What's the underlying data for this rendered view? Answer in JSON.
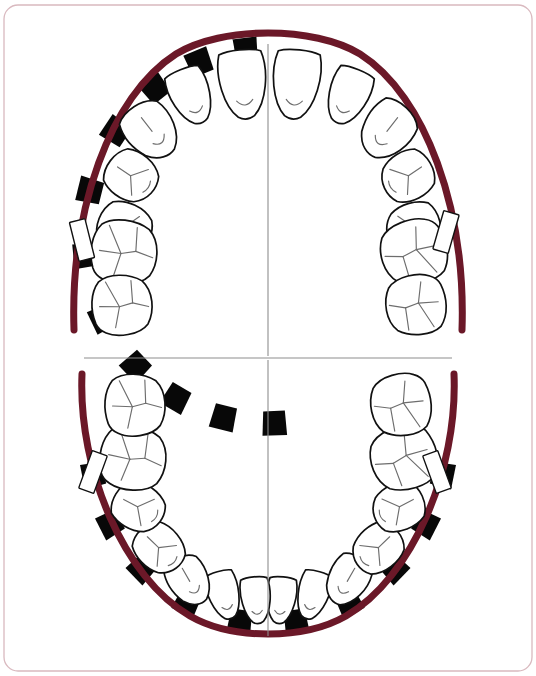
{
  "document": {
    "title": "Dental Arch Chart",
    "type": "odontogram",
    "width": 536,
    "height": 676
  },
  "colors": {
    "arch": "#6b1828",
    "arch_highlight": "#8c2236",
    "tooth_fill": "#ffffff",
    "tooth_outline": "#111111",
    "groove": "#6d6d6d",
    "marker_black": "#080808",
    "marker_white": "#ffffff",
    "frame_border": "#d9b9bf",
    "midline": "#8e8e8e",
    "background": "#ffffff"
  },
  "frame": {
    "x": 4,
    "y": 5,
    "width": 528,
    "height": 666,
    "corner_radius": 14
  },
  "guides": {
    "horizontal_divider": {
      "x1": 84,
      "y1": 358,
      "x2": 452,
      "y2": 358
    },
    "upper_midline": {
      "x1": 268,
      "y1": 44,
      "x2": 268,
      "y2": 356
    },
    "lower_midline": {
      "x1": 268,
      "y1": 360,
      "x2": 268,
      "y2": 636
    }
  },
  "arches": {
    "upper": {
      "label": "Maxillary arch",
      "path": "M 74,330 C 70,210 110,96 176,54 C 222,26 314,26 360,54 C 426,96 466,210 462,330",
      "stroke_width": 7
    },
    "lower": {
      "label": "Mandibular arch",
      "path": "M 82,374 C 78,470 124,578 190,616 C 232,640 304,640 346,616 C 412,578 458,470 454,374",
      "stroke_width": 7
    }
  },
  "teeth": {
    "upper_right_quadrant": [
      {
        "name": "central-incisor",
        "notation": "11",
        "type": "incisor"
      },
      {
        "name": "lateral-incisor",
        "notation": "12",
        "type": "incisor"
      },
      {
        "name": "canine",
        "notation": "13",
        "type": "canine"
      },
      {
        "name": "first-premolar",
        "notation": "14",
        "type": "premolar"
      },
      {
        "name": "second-premolar",
        "notation": "15",
        "type": "premolar"
      },
      {
        "name": "first-molar",
        "notation": "16",
        "type": "molar"
      },
      {
        "name": "second-molar",
        "notation": "17",
        "type": "molar"
      }
    ],
    "upper_left_quadrant": [
      {
        "name": "central-incisor",
        "notation": "21",
        "type": "incisor"
      },
      {
        "name": "lateral-incisor",
        "notation": "22",
        "type": "incisor"
      },
      {
        "name": "canine",
        "notation": "23",
        "type": "canine"
      },
      {
        "name": "first-premolar",
        "notation": "24",
        "type": "premolar"
      },
      {
        "name": "second-premolar",
        "notation": "25",
        "type": "premolar"
      },
      {
        "name": "first-molar",
        "notation": "26",
        "type": "molar"
      },
      {
        "name": "second-molar",
        "notation": "27",
        "type": "molar"
      }
    ],
    "lower_left_quadrant": [
      {
        "name": "central-incisor",
        "notation": "31",
        "type": "incisor"
      },
      {
        "name": "lateral-incisor",
        "notation": "32",
        "type": "incisor"
      },
      {
        "name": "canine",
        "notation": "33",
        "type": "canine"
      },
      {
        "name": "first-premolar",
        "notation": "34",
        "type": "premolar"
      },
      {
        "name": "second-premolar",
        "notation": "35",
        "type": "premolar"
      },
      {
        "name": "first-molar",
        "notation": "36",
        "type": "molar"
      },
      {
        "name": "second-molar",
        "notation": "37",
        "type": "molar"
      }
    ],
    "lower_right_quadrant": [
      {
        "name": "central-incisor",
        "notation": "41",
        "type": "incisor"
      },
      {
        "name": "lateral-incisor",
        "notation": "42",
        "type": "incisor"
      },
      {
        "name": "canine",
        "notation": "43",
        "type": "canine"
      },
      {
        "name": "first-premolar",
        "notation": "44",
        "type": "premolar"
      },
      {
        "name": "second-premolar",
        "notation": "45",
        "type": "premolar"
      },
      {
        "name": "first-molar",
        "notation": "46",
        "type": "molar"
      },
      {
        "name": "second-molar",
        "notation": "47",
        "type": "molar"
      }
    ],
    "total_count": 28
  },
  "markers": {
    "black_segment_label": "interproximal-marker-filled",
    "white_segment_label": "interproximal-marker-open",
    "white_bracket_label": "arch-bracket-marker",
    "white_brackets": [
      {
        "arch": "upper",
        "side": "right",
        "cx": 82,
        "cy": 240,
        "angle": -14
      },
      {
        "arch": "upper",
        "side": "left",
        "cx": 446,
        "cy": 232,
        "angle": 16
      },
      {
        "arch": "lower",
        "side": "right",
        "cx": 93,
        "cy": 472,
        "angle": 20
      },
      {
        "arch": "lower",
        "side": "left",
        "cx": 437,
        "cy": 472,
        "angle": -20
      }
    ]
  },
  "upper_teeth_geometry": [
    {
      "id": "11",
      "cx": 243,
      "cy": 84,
      "rx": 27,
      "ry": 34,
      "rot": -6,
      "shape": "incisor"
    },
    {
      "id": "21",
      "cx": 296,
      "cy": 84,
      "rx": 27,
      "ry": 34,
      "rot": 6,
      "shape": "incisor"
    },
    {
      "id": "12",
      "cx": 191,
      "cy": 96,
      "rx": 23,
      "ry": 28,
      "rot": -22,
      "shape": "incisor"
    },
    {
      "id": "22",
      "cx": 348,
      "cy": 96,
      "rx": 23,
      "ry": 28,
      "rot": 22,
      "shape": "incisor"
    },
    {
      "id": "13",
      "cx": 151,
      "cy": 130,
      "rx": 26,
      "ry": 30,
      "rot": -38,
      "shape": "canine"
    },
    {
      "id": "23",
      "cx": 388,
      "cy": 130,
      "rx": 26,
      "ry": 30,
      "rot": 38,
      "shape": "canine"
    },
    {
      "id": "14",
      "cx": 131,
      "cy": 176,
      "rx": 26,
      "ry": 27,
      "rot": -56,
      "shape": "premolar"
    },
    {
      "id": "24",
      "cx": 408,
      "cy": 176,
      "rx": 26,
      "ry": 27,
      "rot": 56,
      "shape": "premolar"
    },
    {
      "id": "15",
      "cx": 124,
      "cy": 228,
      "rx": 27,
      "ry": 28,
      "rot": -72,
      "shape": "premolar"
    },
    {
      "id": "25",
      "cx": 414,
      "cy": 228,
      "rx": 27,
      "ry": 28,
      "rot": 72,
      "shape": "premolar"
    },
    {
      "id": "16",
      "cx": 124,
      "cy": 252,
      "rx": 33,
      "ry": 34,
      "rot": -80,
      "shape": "molar"
    },
    {
      "id": "26",
      "cx": 414,
      "cy": 252,
      "rx": 33,
      "ry": 34,
      "rot": 80,
      "shape": "molar"
    },
    {
      "id": "17",
      "cx": 122,
      "cy": 305,
      "rx": 31,
      "ry": 31,
      "rot": -88,
      "shape": "molar"
    },
    {
      "id": "27",
      "cx": 416,
      "cy": 305,
      "rx": 31,
      "ry": 31,
      "rot": 88,
      "shape": "molar"
    }
  ],
  "lower_teeth_geometry": [
    {
      "id": "31",
      "cx": 281,
      "cy": 600,
      "rx": 17,
      "ry": 23,
      "rot": 6,
      "shape": "incisor"
    },
    {
      "id": "41",
      "cx": 256,
      "cy": 600,
      "rx": 17,
      "ry": 23,
      "rot": -6,
      "shape": "incisor"
    },
    {
      "id": "32",
      "cx": 313,
      "cy": 595,
      "rx": 18,
      "ry": 24,
      "rot": 16,
      "shape": "incisor"
    },
    {
      "id": "42",
      "cx": 224,
      "cy": 595,
      "rx": 18,
      "ry": 24,
      "rot": -16,
      "shape": "incisor"
    },
    {
      "id": "33",
      "cx": 348,
      "cy": 580,
      "rx": 21,
      "ry": 26,
      "rot": 30,
      "shape": "canine"
    },
    {
      "id": "43",
      "cx": 189,
      "cy": 580,
      "rx": 21,
      "ry": 26,
      "rot": -30,
      "shape": "canine"
    },
    {
      "id": "34",
      "cx": 378,
      "cy": 548,
      "rx": 24,
      "ry": 27,
      "rot": 46,
      "shape": "premolar"
    },
    {
      "id": "44",
      "cx": 159,
      "cy": 548,
      "rx": 24,
      "ry": 27,
      "rot": -46,
      "shape": "premolar"
    },
    {
      "id": "35",
      "cx": 399,
      "cy": 507,
      "rx": 25,
      "ry": 27,
      "rot": 62,
      "shape": "premolar"
    },
    {
      "id": "45",
      "cx": 138,
      "cy": 507,
      "rx": 25,
      "ry": 27,
      "rot": -62,
      "shape": "premolar"
    },
    {
      "id": "36",
      "cx": 404,
      "cy": 458,
      "rx": 33,
      "ry": 34,
      "rot": 76,
      "shape": "molar"
    },
    {
      "id": "46",
      "cx": 133,
      "cy": 458,
      "rx": 33,
      "ry": 34,
      "rot": -76,
      "shape": "molar"
    },
    {
      "id": "37",
      "cx": 401,
      "cy": 405,
      "rx": 32,
      "ry": 31,
      "rot": 86,
      "shape": "molar"
    },
    {
      "id": "47",
      "cx": 135,
      "cy": 405,
      "rx": 32,
      "ry": 31,
      "rot": -86,
      "shape": "molar"
    }
  ],
  "upper_marker_angles": [
    97,
    104,
    112,
    120,
    128,
    137,
    146,
    156,
    166,
    176,
    186,
    196,
    206,
    215,
    224,
    232,
    240,
    248,
    256,
    264,
    272,
    280
  ],
  "lower_marker_angles": [
    12,
    20,
    28,
    36,
    45,
    54,
    63,
    72,
    81,
    90,
    99,
    108,
    117,
    126,
    135,
    144,
    152,
    160,
    168
  ]
}
